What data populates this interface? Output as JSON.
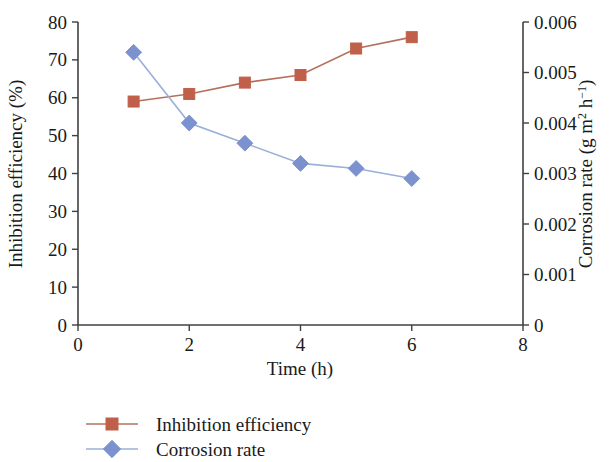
{
  "chart_data": {
    "type": "line",
    "title": "",
    "xlabel": "Time (h)",
    "x": [
      1,
      2,
      3,
      4,
      5,
      6
    ],
    "xlim": [
      0,
      8
    ],
    "xticks": [
      "0",
      "2",
      "4",
      "6",
      "8"
    ],
    "xtick_values": [
      0,
      2,
      4,
      6,
      8
    ],
    "grid": false,
    "legend_position": "bottom-left",
    "axes": [
      {
        "id": "left",
        "ylabel": "Inhibition efficiency (%)",
        "ylim": [
          0,
          80
        ],
        "yticks": [
          "0",
          "10",
          "20",
          "30",
          "40",
          "50",
          "60",
          "70",
          "80"
        ],
        "ytick_values": [
          0,
          10,
          20,
          30,
          40,
          50,
          60,
          70,
          80
        ]
      },
      {
        "id": "right",
        "ylabel_parts": {
          "main": "Corrosion rate (g m",
          "sup1": "2",
          "mid": " h",
          "sup2": "−1",
          "tail": ")"
        },
        "ylabel": "Corrosion rate (g m2 h-1)",
        "ylim": [
          0,
          0.006
        ],
        "yticks": [
          "0",
          "0.001",
          "0.002",
          "0.003",
          "0.004",
          "0.005",
          "0.006"
        ],
        "ytick_values": [
          0,
          0.001,
          0.002,
          0.003,
          0.004,
          0.005,
          0.006
        ]
      }
    ],
    "series": [
      {
        "name": "Inhibition efficiency",
        "axis": "left",
        "marker": "square",
        "color": "#c0604a",
        "line_color": "#b5705c",
        "values": [
          59,
          61,
          64,
          66,
          73,
          76
        ]
      },
      {
        "name": "Corrosion rate",
        "axis": "right",
        "marker": "diamond",
        "color": "#7b92cf",
        "line_color": "#9aafd8",
        "values": [
          0.0054,
          0.004,
          0.0036,
          0.0032,
          0.0031,
          0.0029
        ],
        "values_on_left_scale": [
          72,
          53.5,
          48,
          42.5,
          41.5,
          39
        ]
      }
    ]
  },
  "legend": {
    "items": [
      {
        "label": "Inhibition efficiency",
        "color": "#c0604a",
        "marker": "square"
      },
      {
        "label": "Corrosion rate",
        "color": "#7b92cf",
        "marker": "diamond"
      }
    ]
  }
}
